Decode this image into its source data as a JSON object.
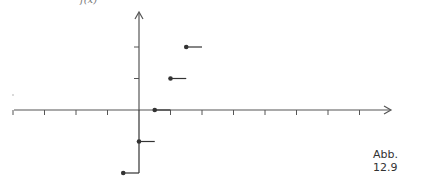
{
  "figure": {
    "caption": "Abb. 12.9",
    "top_label": "f(x)",
    "colors": {
      "axis": "#555555",
      "plot": "#333333"
    }
  },
  "chart_data": {
    "type": "step",
    "title": "",
    "xlabel": "",
    "ylabel": "f(x)",
    "unit_px": 31.5,
    "origin_px": [
      139,
      110
    ],
    "x_ticks": [
      -4,
      -3,
      -2,
      -1,
      1,
      2,
      3,
      4,
      5,
      6,
      7
    ],
    "y_ticks": [
      1,
      2
    ],
    "steps": [
      {
        "x_start": -0.5,
        "x_end": 0,
        "y": -2
      },
      {
        "x_start": 0,
        "x_end": 0.5,
        "y": -1
      },
      {
        "x_start": 0.5,
        "x_end": 1,
        "y": 0
      },
      {
        "x_start": 1,
        "x_end": 1.5,
        "y": 1
      },
      {
        "x_start": 1.5,
        "x_end": 2,
        "y": 2
      }
    ],
    "closed_endpoints": [
      [
        -0.5,
        -2
      ],
      [
        0,
        -1
      ],
      [
        0.5,
        0
      ],
      [
        1,
        1
      ],
      [
        1.5,
        2
      ]
    ],
    "vertical_segment": {
      "x": 0,
      "y_from": -2,
      "y_to": 0
    }
  }
}
